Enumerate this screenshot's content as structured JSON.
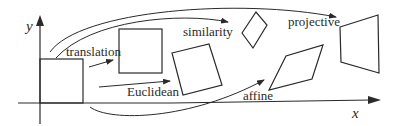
{
  "diagram": {
    "colors": {
      "stroke": "#2a2a2a",
      "background": "#ffffff"
    },
    "axes": {
      "x_label": "x",
      "y_label": "y"
    },
    "labels": {
      "translation": "translation",
      "euclidean": "Euclidean",
      "similarity": "similarity",
      "affine": "affine",
      "projective": "projective"
    },
    "shapes": [
      {
        "name": "original-square",
        "type": "square"
      },
      {
        "name": "translation-result",
        "type": "square"
      },
      {
        "name": "euclidean-result",
        "type": "rotated square"
      },
      {
        "name": "similarity-result",
        "type": "scaled rotated square"
      },
      {
        "name": "affine-result",
        "type": "parallelogram"
      },
      {
        "name": "projective-result",
        "type": "general quadrilateral"
      }
    ]
  }
}
